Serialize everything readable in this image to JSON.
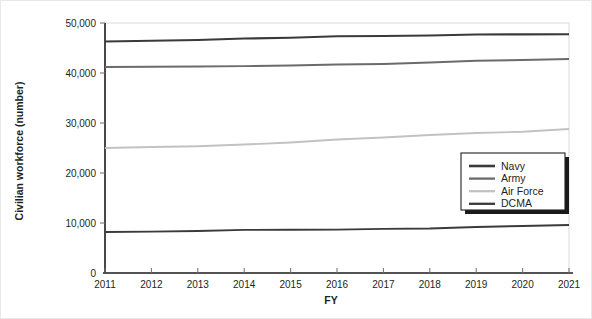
{
  "chart_data": {
    "type": "line",
    "title": "",
    "xlabel": "FY",
    "ylabel": "Civilian workforce (number)",
    "x": [
      2011,
      2012,
      2013,
      2014,
      2015,
      2016,
      2017,
      2018,
      2019,
      2020,
      2021
    ],
    "xtick_labels": [
      "2011",
      "2012",
      "2013",
      "2014",
      "2015",
      "2016",
      "2017",
      "2018",
      "2019",
      "2020",
      "2021"
    ],
    "ytick_labels": [
      "0",
      "10,000",
      "20,000",
      "30,000",
      "40,000",
      "50,000"
    ],
    "yticks": [
      0,
      10000,
      20000,
      30000,
      40000,
      50000
    ],
    "ylim": [
      0,
      50000
    ],
    "xlim": [
      2011,
      2021
    ],
    "grid": false,
    "legend_position": "lower-right",
    "series": [
      {
        "name": "Navy",
        "color": "#3a3a3a",
        "width": 2.2,
        "values": [
          46300,
          46450,
          46600,
          46900,
          47050,
          47350,
          47400,
          47500,
          47700,
          47720,
          47750
        ]
      },
      {
        "name": "Army",
        "color": "#6b6b6b",
        "width": 1.9,
        "values": [
          41200,
          41250,
          41300,
          41380,
          41500,
          41700,
          41800,
          42100,
          42450,
          42600,
          42800
        ]
      },
      {
        "name": "Air Force",
        "color": "#c2c2c2",
        "width": 1.9,
        "values": [
          25000,
          25200,
          25350,
          25700,
          26100,
          26700,
          27100,
          27600,
          28000,
          28250,
          28800
        ]
      },
      {
        "name": "DCMA",
        "color": "#3a3a3a",
        "width": 1.9,
        "values": [
          8200,
          8280,
          8400,
          8620,
          8640,
          8680,
          8820,
          8900,
          9200,
          9400,
          9600
        ]
      }
    ]
  },
  "legend": {
    "entries": [
      "Navy",
      "Army",
      "Air Force",
      "DCMA"
    ]
  }
}
